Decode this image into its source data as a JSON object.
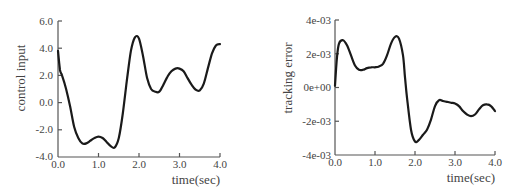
{
  "chart_data": [
    {
      "type": "line",
      "title": "",
      "xlabel": "time(sec)",
      "ylabel": "control input",
      "xlim": [
        0.0,
        4.0
      ],
      "ylim": [
        -4.0,
        6.0
      ],
      "xticks": [
        "0.0",
        "1.0",
        "2.0",
        "3.0",
        "4.0"
      ],
      "yticks": [
        "6.0",
        "4.0",
        "2.0",
        "0.0",
        "-2.0",
        "-4.0"
      ],
      "grid": false,
      "legend": null,
      "series": [
        {
          "name": "control input",
          "x": [
            0.0,
            0.05,
            0.1,
            0.2,
            0.3,
            0.4,
            0.5,
            0.6,
            0.7,
            0.8,
            0.9,
            1.0,
            1.1,
            1.2,
            1.3,
            1.4,
            1.5,
            1.6,
            1.7,
            1.8,
            1.9,
            2.0,
            2.1,
            2.2,
            2.3,
            2.4,
            2.5,
            2.6,
            2.7,
            2.8,
            2.9,
            3.0,
            3.1,
            3.2,
            3.3,
            3.4,
            3.5,
            3.6,
            3.7,
            3.8,
            3.9,
            4.0
          ],
          "y": [
            3.8,
            2.4,
            2.0,
            1.0,
            -0.3,
            -1.8,
            -2.6,
            -3.0,
            -3.0,
            -2.8,
            -2.6,
            -2.5,
            -2.6,
            -2.9,
            -3.2,
            -3.3,
            -2.6,
            -0.8,
            1.6,
            3.8,
            4.8,
            4.7,
            3.4,
            1.8,
            1.0,
            0.8,
            0.8,
            1.3,
            1.9,
            2.3,
            2.5,
            2.5,
            2.3,
            1.8,
            1.3,
            0.95,
            0.9,
            1.4,
            2.5,
            3.6,
            4.2,
            4.3
          ]
        }
      ]
    },
    {
      "type": "line",
      "title": "",
      "xlabel": "time(sec)",
      "ylabel": "tracking error",
      "xlim": [
        0.0,
        4.0
      ],
      "ylim": [
        -0.004,
        0.004
      ],
      "xticks": [
        "0.0",
        "1.0",
        "2.0",
        "3.0",
        "4.0"
      ],
      "yticks": [
        "4e-03",
        "2e-03",
        "0e+00",
        "-2e-03",
        "-4e-03"
      ],
      "grid": false,
      "legend": null,
      "series": [
        {
          "name": "tracking error",
          "x": [
            0.0,
            0.05,
            0.1,
            0.2,
            0.3,
            0.4,
            0.5,
            0.6,
            0.7,
            0.8,
            0.9,
            1.0,
            1.1,
            1.2,
            1.3,
            1.4,
            1.5,
            1.6,
            1.7,
            1.75,
            1.8,
            1.9,
            2.0,
            2.1,
            2.2,
            2.3,
            2.4,
            2.5,
            2.6,
            2.7,
            2.8,
            2.9,
            3.0,
            3.1,
            3.2,
            3.3,
            3.4,
            3.5,
            3.6,
            3.7,
            3.8,
            3.9,
            4.0
          ],
          "y": [
            0.0001,
            0.0018,
            0.0026,
            0.0028,
            0.0025,
            0.0019,
            0.0013,
            0.00105,
            0.00105,
            0.00115,
            0.0012,
            0.0012,
            0.00125,
            0.0014,
            0.0019,
            0.0026,
            0.003,
            0.0029,
            0.0019,
            0.0006,
            -0.0006,
            -0.0025,
            -0.0032,
            -0.0031,
            -0.0028,
            -0.0025,
            -0.0019,
            -0.0011,
            -0.00075,
            -0.0008,
            -0.00085,
            -0.0009,
            -0.00095,
            -0.0011,
            -0.0014,
            -0.0016,
            -0.0017,
            -0.0016,
            -0.0013,
            -0.00105,
            -0.001,
            -0.0011,
            -0.0014
          ]
        }
      ]
    }
  ],
  "charts": {
    "left": {
      "ylabel": "control input",
      "xlabel": "time(sec)",
      "yticks": [
        "6.0",
        "4.0",
        "2.0",
        "0.0",
        "-2.0",
        "-4.0"
      ],
      "xticks": [
        "0.0",
        "1.0",
        "2.0",
        "3.0",
        "4.0"
      ]
    },
    "right": {
      "ylabel": "tracking error",
      "xlabel": "time(sec)",
      "yticks": [
        "4e-03",
        "2e-03",
        "0e+00",
        "-2e-03",
        "-4e-03"
      ],
      "xticks": [
        "0.0",
        "1.0",
        "2.0",
        "3.0",
        "4.0"
      ]
    }
  }
}
